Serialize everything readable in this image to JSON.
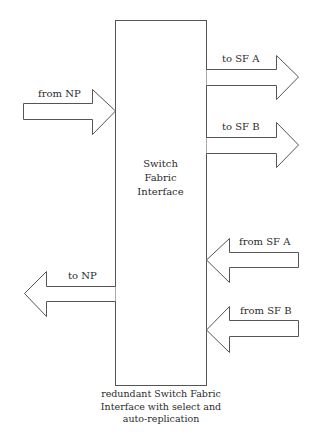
{
  "diagram": {
    "box": {
      "label_lines": [
        "Switch",
        "Fabric",
        "Interface"
      ]
    },
    "caption_lines": [
      "redundant Switch Fabric",
      "Interface with select and",
      "auto-replication"
    ],
    "arrows": {
      "from_np": {
        "label": "from NP",
        "direction": "right"
      },
      "to_sf_a": {
        "label": "to SF A",
        "direction": "right"
      },
      "to_sf_b": {
        "label": "to SF B",
        "direction": "right"
      },
      "to_np": {
        "label": "to NP",
        "direction": "left"
      },
      "from_sf_a": {
        "label": "from SF A",
        "direction": "left"
      },
      "from_sf_b": {
        "label": "from SF B",
        "direction": "left"
      }
    },
    "colors": {
      "stroke": "#555555",
      "text": "#2b2b2b",
      "background": "#ffffff"
    }
  }
}
